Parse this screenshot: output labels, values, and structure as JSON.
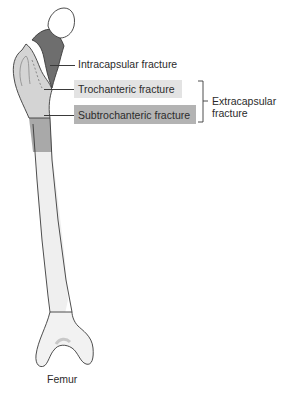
{
  "labels": {
    "intracapsular": "Intracapsular fracture",
    "trochanteric": "Trochanteric fracture",
    "subtrochanteric": "Subtrochanteric fracture",
    "extracapsular_line1": "Extracapsular",
    "extracapsular_line2": "fracture",
    "bone_name": "Femur"
  },
  "colors": {
    "intracapsular_region": "#6e6e6e",
    "trochanteric_region": "#d4d4d4",
    "subtrochanteric_region": "#a9a9a9",
    "shaft": "#efefef",
    "head": "#ffffff",
    "outline": "#3a3a3a",
    "trochanteric_box": "#e3e3e3",
    "subtrochanteric_box": "#b3b3b3"
  }
}
